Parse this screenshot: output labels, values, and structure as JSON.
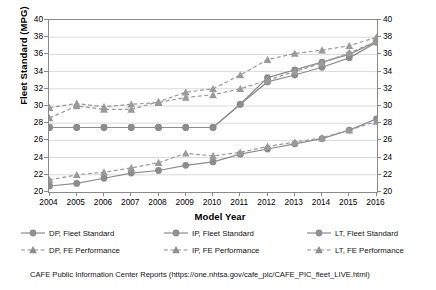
{
  "chart_data": {
    "type": "line",
    "title": "",
    "xlabel": "Model Year",
    "ylabel": "Fleet Standard (MPG)",
    "ylabel_right": "FE Performance (MPG)",
    "grid": true,
    "legend_position": "bottom",
    "ylim": [
      20,
      40
    ],
    "ylim_right": [
      20,
      40
    ],
    "ytick_step": 2,
    "yticks": [
      20,
      22,
      24,
      26,
      28,
      30,
      32,
      34,
      36,
      38,
      40
    ],
    "yticks_right": [
      20,
      22,
      24,
      26,
      28,
      30,
      32,
      34,
      36,
      38,
      40
    ],
    "categories": [
      2004,
      2005,
      2006,
      2007,
      2008,
      2009,
      2010,
      2011,
      2012,
      2013,
      2014,
      2015,
      2016
    ],
    "xticks": [
      "2004",
      "2005",
      "2006",
      "2007",
      "2008",
      "2009",
      "2010",
      "2011",
      "2012",
      "2013",
      "2014",
      "2015",
      "2016"
    ],
    "series": [
      {
        "name": "DP, Fleet Standard",
        "marker": "circle",
        "line_style": "solid",
        "color": "#8c8c8c",
        "values": [
          27.5,
          27.5,
          27.5,
          27.5,
          27.5,
          27.5,
          27.5,
          30.2,
          33.3,
          34.2,
          35.1,
          36.0,
          37.5
        ]
      },
      {
        "name": "IP, Fleet Standard",
        "marker": "circle",
        "line_style": "solid",
        "color": "#8c8c8c",
        "values": [
          27.5,
          27.5,
          27.5,
          27.5,
          27.5,
          27.5,
          27.5,
          30.2,
          32.8,
          33.6,
          34.5,
          35.6,
          37.4
        ]
      },
      {
        "name": "LT, Fleet Standard",
        "marker": "circle",
        "line_style": "solid",
        "color": "#8c8c8c",
        "values": [
          20.7,
          21.0,
          21.6,
          22.2,
          22.5,
          23.1,
          23.5,
          24.4,
          25.0,
          25.6,
          26.2,
          27.2,
          28.5
        ]
      },
      {
        "name": "DP, FE Performance",
        "marker": "triangle",
        "line_style": "dashed",
        "color": "#9a9a9a",
        "values": [
          28.6,
          30.0,
          29.6,
          29.6,
          30.5,
          31.6,
          32.0,
          33.6,
          35.4,
          36.1,
          36.5,
          37.0,
          38.0
        ]
      },
      {
        "name": "IP, FE Performance",
        "marker": "triangle",
        "line_style": "dashed",
        "color": "#9a9a9a",
        "values": [
          29.8,
          30.3,
          29.9,
          30.2,
          30.4,
          31.0,
          31.3,
          32.0,
          33.0,
          34.0,
          35.0,
          36.2,
          37.5
        ]
      },
      {
        "name": "LT, FE Performance",
        "marker": "triangle",
        "line_style": "dashed",
        "color": "#9a9a9a",
        "values": [
          21.4,
          22.0,
          22.3,
          22.8,
          23.4,
          24.5,
          24.2,
          24.6,
          25.3,
          25.8,
          26.3,
          27.2,
          28.2
        ]
      }
    ],
    "footnote": "CAFE Public Information Center Reports (https://one.nhtsa.gov/cafe_pic/CAFE_PIC_fleet_LIVE.html)"
  },
  "axes": {
    "left_title": "Fleet Standard (MPG)",
    "right_title": "FE Performance (MPG)",
    "x_title": "Model Year"
  },
  "legend": {
    "items": [
      {
        "label": "DP, Fleet Standard",
        "marker": "circle",
        "style": "solid"
      },
      {
        "label": "IP, Fleet Standard",
        "marker": "circle",
        "style": "solid"
      },
      {
        "label": "LT, Fleet Standard",
        "marker": "circle",
        "style": "solid"
      },
      {
        "label": "DP, FE Performance",
        "marker": "triangle",
        "style": "dashed"
      },
      {
        "label": "IP, FE Performance",
        "marker": "triangle",
        "style": "dashed"
      },
      {
        "label": "LT, FE Performance",
        "marker": "triangle",
        "style": "dashed"
      }
    ]
  },
  "footnote": "CAFE Public Information Center Reports (https://one.nhtsa.gov/cafe_pic/CAFE_PIC_fleet_LIVE.html)",
  "colors": {
    "line": "#8c8c8c",
    "marker": "#8f8f8f",
    "grid": "#d9d9d9",
    "axis": "#8a8a8a",
    "text": "#000000"
  }
}
